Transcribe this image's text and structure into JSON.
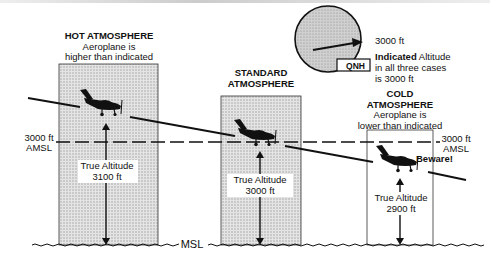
{
  "diagram": {
    "gauge": {
      "reading": "3000 ft",
      "setting_label": "QNH",
      "note_bold": "Indicated",
      "note_rest": " Altitude",
      "note_line2": "in all three cases",
      "note_line3": "is 3000 ft"
    },
    "reference_line": {
      "left_label_1": "3000 ft",
      "left_label_2": "AMSL",
      "right_label_1": "3000 ft",
      "right_label_2": "AMSL"
    },
    "sea_level_label": "MSL",
    "cases": [
      {
        "title": "HOT ATMOSPHERE",
        "subtitle_1": "Aeroplane is",
        "subtitle_2": "higher than indicated",
        "true_altitude_label": "True Altitude",
        "true_altitude_value": "3100 ft"
      },
      {
        "title_1": "STANDARD",
        "title_2": "ATMOSPHERE",
        "true_altitude_label": "True Altitude",
        "true_altitude_value": "3000 ft"
      },
      {
        "title_1": "COLD",
        "title_2": "ATMOSPHERE",
        "subtitle_1": "Aeroplane is",
        "subtitle_2": "lower than indicated",
        "true_altitude_label": "True Altitude",
        "true_altitude_value": "2900 ft",
        "warning": "Beware!"
      }
    ],
    "colors": {
      "ink": "#111111",
      "box_fill": "#d9d9d9",
      "gauge_fill": "#cfcfcf"
    }
  }
}
